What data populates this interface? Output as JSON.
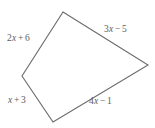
{
  "figure": {
    "type": "geometry-diagram",
    "shape_name": "quadrilateral",
    "background_color": "#ffffff",
    "stroke_color": "#6b6b6b",
    "text_color": "#5d5d5d",
    "fill_color": "none",
    "stroke_width": 1.1,
    "vertices": [
      {
        "name": "top",
        "x": 63,
        "y": 12
      },
      {
        "name": "right",
        "x": 148,
        "y": 65
      },
      {
        "name": "bottom",
        "x": 53,
        "y": 122
      },
      {
        "name": "left",
        "x": 22,
        "y": 76
      }
    ],
    "polygon_points": "63,12 148,65 53,122 22,76",
    "side_labels": [
      {
        "id": "upper-left",
        "text": "2x + 6",
        "coefficient": "2",
        "variable": "x",
        "operator": "+",
        "constant": "6",
        "from_vertex": "left",
        "to_vertex": "top"
      },
      {
        "id": "upper-right",
        "text": "3x − 5",
        "coefficient": "3",
        "variable": "x",
        "operator": "−",
        "constant": "5",
        "from_vertex": "top",
        "to_vertex": "right"
      },
      {
        "id": "lower-left",
        "text": "x + 3",
        "coefficient": "",
        "variable": "x",
        "operator": "+",
        "constant": "3",
        "from_vertex": "left",
        "to_vertex": "bottom"
      },
      {
        "id": "lower-right",
        "text": "4x − 1",
        "coefficient": "4",
        "variable": "x",
        "operator": "−",
        "constant": "1",
        "from_vertex": "bottom",
        "to_vertex": "right"
      }
    ]
  }
}
